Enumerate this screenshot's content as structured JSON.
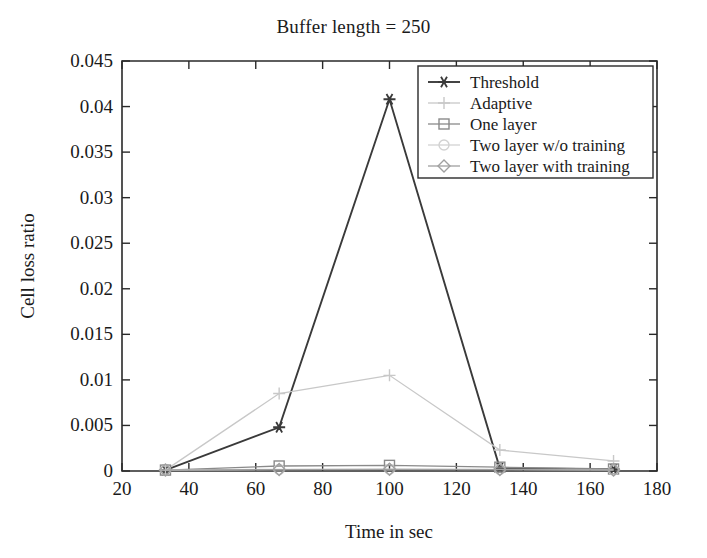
{
  "chart_data": {
    "type": "line",
    "title": "Buffer length = 250",
    "xlabel": "Time in sec",
    "ylabel": "Cell loss ratio",
    "xlim": [
      20,
      180
    ],
    "ylim": [
      0,
      0.045
    ],
    "grid": false,
    "legend_position": "top-right",
    "x": [
      33,
      67,
      100,
      133,
      167
    ],
    "xticks": [
      20,
      40,
      60,
      80,
      100,
      120,
      140,
      160,
      180
    ],
    "xtick_labels": [
      "20",
      "40",
      "60",
      "80",
      "100",
      "120",
      "140",
      "160",
      "180"
    ],
    "yticks": [
      0,
      0.005,
      0.01,
      0.015,
      0.02,
      0.025,
      0.03,
      0.035,
      0.04,
      0.045
    ],
    "ytick_labels": [
      "0",
      "0.005",
      "0.01",
      "0.015",
      "0.02",
      "0.025",
      "0.03",
      "0.035",
      "0.04",
      "0.045"
    ],
    "series": [
      {
        "name": "Threshold",
        "marker": "star",
        "color": "#3a3a3a",
        "values": [
          0.0001,
          0.0048,
          0.0408,
          0.0003,
          0.0002
        ]
      },
      {
        "name": "Adaptive",
        "marker": "plus",
        "color": "#c8c8c8",
        "values": [
          0.0001,
          0.0085,
          0.0105,
          0.0023,
          0.0011
        ]
      },
      {
        "name": "One layer",
        "marker": "square",
        "color": "#8a8a8a",
        "values": [
          0.0001,
          0.00055,
          0.00062,
          0.00042,
          0.00022
        ]
      },
      {
        "name": "Two layer w/o training",
        "marker": "circle",
        "color": "#d2d2d2",
        "values": [
          0.0001,
          0.00018,
          0.0002,
          0.00018,
          0.00012
        ]
      },
      {
        "name": "Two layer with training",
        "marker": "diamond",
        "color": "#a0a0a0",
        "values": [
          0.0001,
          0.00016,
          0.00018,
          0.00016,
          0.00011
        ]
      }
    ]
  },
  "legend": {
    "entries": [
      {
        "label": "Threshold"
      },
      {
        "label": "Adaptive"
      },
      {
        "label": "One layer"
      },
      {
        "label": "Two layer w/o training"
      },
      {
        "label": "Two layer with training"
      }
    ]
  },
  "colors": {
    "axis": "#2a2a2a",
    "text": "#1a1a1a",
    "background": "#ffffff"
  }
}
